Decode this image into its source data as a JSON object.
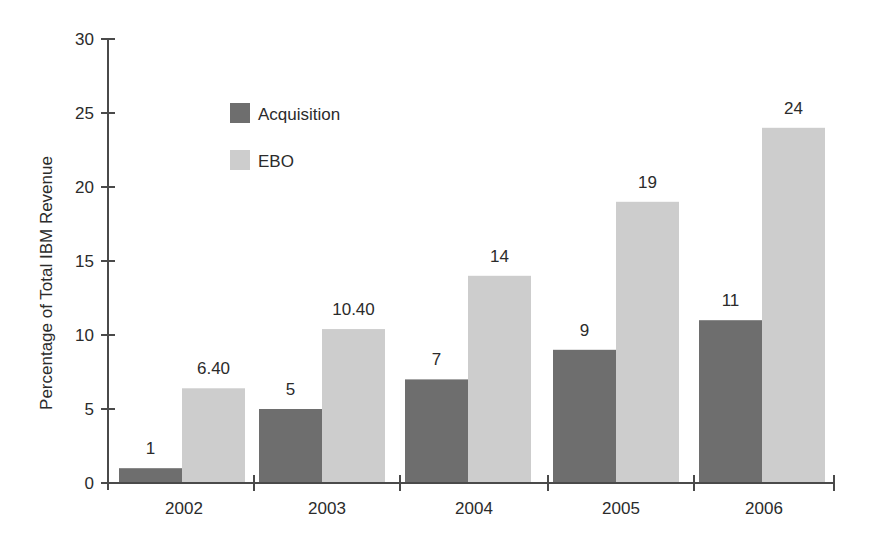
{
  "chart_data": {
    "type": "bar",
    "title": "",
    "xlabel": "",
    "ylabel": "Percentage of Total IBM Revenue",
    "categories": [
      "2002",
      "2003",
      "2004",
      "2005",
      "2006"
    ],
    "series": [
      {
        "name": "Acquisition",
        "values": [
          1,
          5,
          7,
          9,
          11
        ],
        "labels": [
          "1",
          "5",
          "7",
          "9",
          "11"
        ],
        "color": "#6e6e6e"
      },
      {
        "name": "EBO",
        "values": [
          6.4,
          10.4,
          14,
          19,
          24
        ],
        "labels": [
          "6.40",
          "10.40",
          "14",
          "19",
          "24"
        ],
        "color": "#cdcdcd"
      }
    ],
    "ylim": [
      0,
      30
    ],
    "yticks": [
      0,
      5,
      10,
      15,
      20,
      25,
      30
    ],
    "grid": false,
    "legend": {
      "position": "upper-left-inside",
      "entries": [
        "Acquisition",
        "EBO"
      ]
    }
  },
  "colors": {
    "axis": "#4a4a4a",
    "text": "#2b2b2b",
    "acquisition": "#6e6e6e",
    "ebo": "#cdcdcd"
  }
}
